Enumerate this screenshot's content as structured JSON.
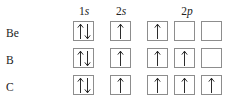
{
  "headers": {
    "row_label_column": "",
    "columns": [
      {
        "name": "1s",
        "shell": "1",
        "subshell": "s"
      },
      {
        "name": "2s",
        "shell": "2",
        "subshell": "s"
      },
      {
        "name": "2p",
        "shell": "2",
        "subshell": "p"
      }
    ]
  },
  "colors": {
    "box_border": "#8d8d8d",
    "arrow": "#2b2b2b",
    "text": "#1a1a1a",
    "background": "#ffffff"
  },
  "rows": [
    {
      "element": "Be",
      "orbitals": {
        "1s": [
          "paired"
        ],
        "2s": [
          "single"
        ],
        "2p": [
          "single",
          "empty",
          "empty"
        ]
      }
    },
    {
      "element": "B",
      "orbitals": {
        "1s": [
          "paired"
        ],
        "2s": [
          "single"
        ],
        "2p": [
          "single",
          "single",
          "empty"
        ]
      }
    },
    {
      "element": "C",
      "orbitals": {
        "1s": [
          "paired"
        ],
        "2s": [
          "single"
        ],
        "2p": [
          "single",
          "single",
          "single"
        ]
      }
    }
  ],
  "icons": {
    "spin_up": "up-arrow-icon",
    "spin_down": "down-arrow-icon"
  }
}
